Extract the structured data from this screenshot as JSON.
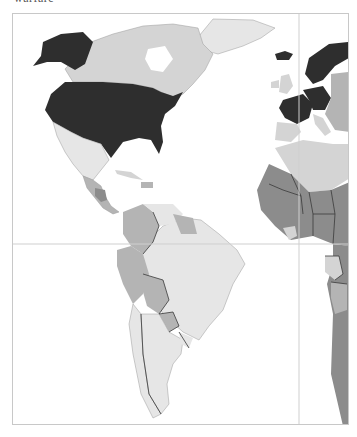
{
  "caption": "warfare",
  "map": {
    "type": "choropleth",
    "color_scheme": "grayscale",
    "visible_region": "Americas, Western Europe, West Africa",
    "classes": {
      "dark": "#2e2e2e",
      "mid": "#8c8c8c",
      "mid_light": "#b4b4b4",
      "light": "#d4d4d4",
      "very_light": "#e6e6e6"
    },
    "regions": [
      {
        "name": "United States",
        "class": "dark"
      },
      {
        "name": "Alaska",
        "class": "dark"
      },
      {
        "name": "Canada",
        "class": "light"
      },
      {
        "name": "Greenland",
        "class": "very_light"
      },
      {
        "name": "Iceland",
        "class": "dark"
      },
      {
        "name": "Mexico",
        "class": "very_light"
      },
      {
        "name": "Central America",
        "class": "mid_light"
      },
      {
        "name": "Honduras",
        "class": "mid"
      },
      {
        "name": "Cuba",
        "class": "light"
      },
      {
        "name": "Colombia",
        "class": "mid_light"
      },
      {
        "name": "Venezuela",
        "class": "very_light"
      },
      {
        "name": "Guianas",
        "class": "mid_light"
      },
      {
        "name": "Brazil",
        "class": "very_light"
      },
      {
        "name": "Peru",
        "class": "mid_light"
      },
      {
        "name": "Ecuador",
        "class": "mid_light"
      },
      {
        "name": "Bolivia",
        "class": "mid_light"
      },
      {
        "name": "Paraguay",
        "class": "mid_light"
      },
      {
        "name": "Chile",
        "class": "very_light"
      },
      {
        "name": "Argentina",
        "class": "very_light"
      },
      {
        "name": "Uruguay",
        "class": "very_light"
      },
      {
        "name": "France",
        "class": "dark"
      },
      {
        "name": "Germany",
        "class": "dark"
      },
      {
        "name": "Scandinavia",
        "class": "dark"
      },
      {
        "name": "United Kingdom",
        "class": "light"
      },
      {
        "name": "Spain",
        "class": "light"
      },
      {
        "name": "Italy",
        "class": "light"
      },
      {
        "name": "Eastern Europe",
        "class": "mid_light"
      },
      {
        "name": "North Africa",
        "class": "light"
      },
      {
        "name": "West Africa",
        "class": "mid"
      },
      {
        "name": "Central Africa",
        "class": "mid"
      },
      {
        "name": "Gabon/Congo",
        "class": "light"
      }
    ],
    "gridlines": {
      "equator": true,
      "prime_meridian": true
    }
  }
}
